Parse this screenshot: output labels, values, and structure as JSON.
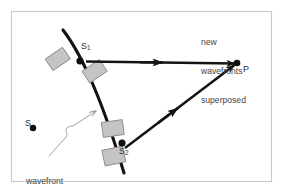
{
  "figure": {
    "background_color": "#ffffff",
    "border_color": "#c9c9c9",
    "ink_color": "#111111",
    "plate_fill": "#c3c3c3",
    "plate_stroke": "#8d8d8d",
    "text_color": "#3a3a3a",
    "pointer_color": "#9a9a9a"
  },
  "labels": {
    "new_wavefronts": "new\nwavefronts\nsuperposed",
    "point_p": "P",
    "source_s": "S",
    "wavefront_from_s": "wavefront\nfrom S",
    "slit_1": "S",
    "slit_1_sub": "1",
    "slit_2": "S",
    "slit_2_sub": "2"
  },
  "geometry": {
    "frame": {
      "x": 11,
      "y": 11,
      "width": 261,
      "height": 171
    },
    "point_s": {
      "x": 32,
      "y": 128,
      "r": 3.1
    },
    "point_p": {
      "x": 237,
      "y": 63,
      "r": 3.2
    },
    "node_s1": {
      "x": 80,
      "y": 60,
      "r": 3.4
    },
    "node_s2": {
      "x": 122,
      "y": 143,
      "r": 3.4
    },
    "ray_upper": {
      "from_x": 84,
      "from_y": 61,
      "to_x": 236,
      "to_y": 63
    },
    "ray_lower": {
      "from_x": 124,
      "from_y": 147,
      "to_x": 236,
      "to_y": 64
    },
    "wavefront_arc": "M 63,31 C 74,44 84,62 95,88 C 106,114 115,143 124,172",
    "pointer_tip": {
      "x": 98,
      "y": 109
    }
  }
}
